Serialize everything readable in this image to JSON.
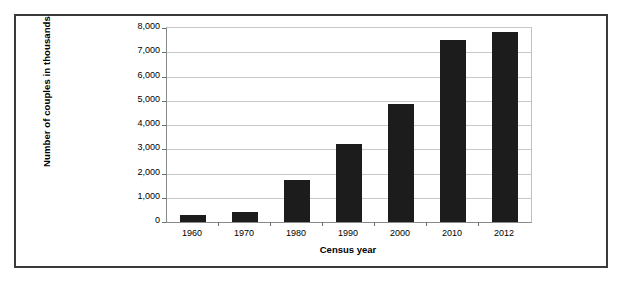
{
  "chart_data": {
    "type": "bar",
    "title": "",
    "xlabel": "Census year",
    "ylabel": "Number of couples in thousands",
    "categories": [
      "1960",
      "1970",
      "1980",
      "1990",
      "2000",
      "2010",
      "2012"
    ],
    "values": [
      280,
      430,
      1750,
      3200,
      4850,
      7500,
      7850
    ],
    "ylim": [
      0,
      8000
    ],
    "ytick_labels": [
      "8,000",
      "7,000",
      "6,000",
      "5,000",
      "4,000",
      "3,000",
      "2,000",
      "1,000",
      "0"
    ],
    "ytick_values": [
      8000,
      7000,
      6000,
      5000,
      4000,
      3000,
      2000,
      1000,
      0
    ],
    "grid": true,
    "legend": "none",
    "bar_color": "#1c1c1c",
    "gridline_color": "#c8c8c8",
    "axis_color": "#8a8a8a",
    "frame_color": "#3a3a3a",
    "background_color": "#ffffff"
  }
}
